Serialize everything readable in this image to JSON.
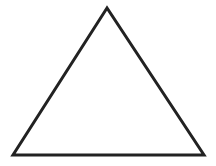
{
  "diagram": {
    "shape": "triangle",
    "type": "equilateral-outline",
    "vertices": {
      "apex": [
        107,
        8
      ],
      "bottom_left": [
        13,
        155
      ],
      "bottom_right": [
        204,
        155
      ]
    },
    "stroke_color": "#222222",
    "fill_color": "#ffffff",
    "stroke_width": 3
  }
}
